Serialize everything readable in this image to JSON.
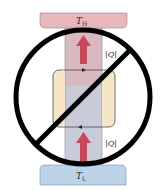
{
  "diagram": {
    "type": "heat-engine-prohibited",
    "hot_reservoir": {
      "label": "T",
      "subscript": "H",
      "color": "#e8b7bb"
    },
    "cold_reservoir": {
      "label": "T",
      "subscript": "L",
      "color": "#bcd3ea"
    },
    "engine": {
      "color": "#f6e6c8"
    },
    "column": {
      "upper_color": "#d9b9c0",
      "lower_color": "#c9cbd8"
    },
    "heat_flows": [
      {
        "label": "|Q|",
        "direction": "up",
        "position": "upper",
        "color": "#c8485e"
      },
      {
        "label": "|Q|",
        "direction": "up",
        "position": "lower",
        "color": "#c8485e"
      }
    ],
    "prohibition_symbol": {
      "shape": "circle-slash",
      "color": "#000000"
    }
  }
}
